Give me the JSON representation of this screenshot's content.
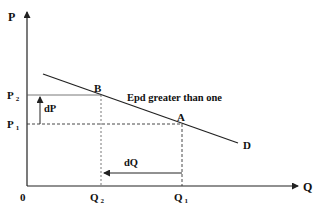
{
  "diagram": {
    "axes": {
      "y_label": "P",
      "x_label": "Q",
      "origin_label": "0"
    },
    "price_levels": [
      {
        "label": "P",
        "sub": "2"
      },
      {
        "label": "P",
        "sub": "1"
      }
    ],
    "quantity_levels": [
      {
        "label": "Q",
        "sub": "2"
      },
      {
        "label": "Q",
        "sub": "1"
      }
    ],
    "points": {
      "a": "A",
      "b": "B"
    },
    "curve_label": "D",
    "annotation": "Epd greater than one",
    "change_labels": {
      "price_change": "dP",
      "quantity_change": "dQ"
    },
    "colors": {
      "line": "#222222",
      "dashed": "#333333",
      "text": "#111111"
    }
  }
}
